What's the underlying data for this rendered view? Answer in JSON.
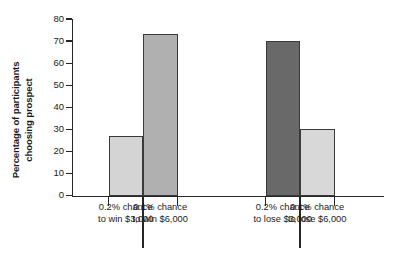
{
  "chart_data": {
    "type": "bar",
    "title": "",
    "subtitle": "",
    "xlabel": "",
    "ylabel": "Percentage of participants choosing prospect",
    "ylabel_lines": [
      "Percentage of participants",
      "choosing prospect"
    ],
    "ylim": [
      0,
      80
    ],
    "yticks": [
      0,
      10,
      20,
      30,
      40,
      50,
      60,
      70,
      80
    ],
    "ytick_labels": [
      "0",
      "10",
      "20",
      "30",
      "40",
      "50",
      "60",
      "70",
      "80"
    ],
    "grid": false,
    "legend": "none",
    "categories": [
      "0.2% chance to win $3,000",
      "0.1% chance to win $6,000",
      "0.2% chance to lose $3,000",
      "0.1% chance to lose $6,000"
    ],
    "category_lines": [
      [
        "0.2% chance",
        "to win $3,000"
      ],
      [
        "0.1% chance",
        "to win $6,000"
      ],
      [
        "0.2% chance",
        "to lose $3,000"
      ],
      [
        "0.1% chance",
        "to lose $6,000"
      ]
    ],
    "values": [
      27,
      73,
      70,
      30
    ],
    "bar_colors": [
      "#d4d4d4",
      "#b0b0b0",
      "#696969",
      "#d8d8d8"
    ],
    "bar_edge_color": "#3a3a3a",
    "axis_color": "#262626",
    "background_color": "#ffffff",
    "group_gap_note": "gap between win pair and lose pair"
  }
}
